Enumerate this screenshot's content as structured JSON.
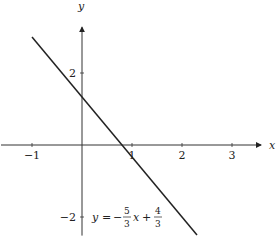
{
  "chart_data": {
    "type": "line",
    "title": "",
    "xlabel": "x",
    "ylabel": "y",
    "xlim": [
      -1.5,
      3.5
    ],
    "ylim": [
      -2.6,
      3.3
    ],
    "x_ticks": [
      -1,
      1,
      2,
      3
    ],
    "x_tick_labels": [
      "−1",
      "1",
      "2",
      "3"
    ],
    "y_ticks": [
      2,
      -2
    ],
    "y_tick_labels": [
      "2",
      "−2"
    ],
    "grid": false,
    "series": [
      {
        "name": "y = -5/3 x + 4/3",
        "slope": -1.6667,
        "intercept": 1.3333,
        "x": [
          -1,
          2.3
        ],
        "y": [
          3,
          -2.5
        ]
      }
    ],
    "annotation": {
      "lhs": "y",
      "equals": "=",
      "minus": "−",
      "frac1_num": "5",
      "frac1_den": "3",
      "var": "x",
      "plus": "+",
      "frac2_num": "4",
      "frac2_den": "3"
    }
  }
}
